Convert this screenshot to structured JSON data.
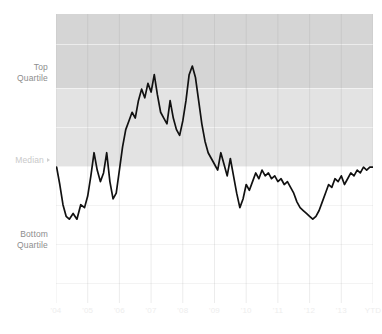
{
  "chart_data": {
    "type": "line",
    "title": "",
    "subtitle": "",
    "xlabel": "",
    "ylabel": "",
    "grid": true,
    "legend_position": "none",
    "y_axis": {
      "kind": "quartile-bands",
      "tick_labels": [
        "Top Quartile",
        "Median",
        "Bottom Quartile"
      ],
      "band_labels": {
        "top_quartile": "Top\nQuartile",
        "median": "Median",
        "bottom_quartile": "Bottom\nQuartile"
      },
      "ylim": [
        0,
        100
      ],
      "reference_lines": [
        {
          "name": "top-quartile",
          "value": 74
        },
        {
          "name": "median",
          "value": 47
        }
      ]
    },
    "x_axis": {
      "tick_labels": [
        "'04",
        "'05",
        "'06",
        "'07",
        "'08",
        "'09",
        "'10",
        "'11",
        "'12",
        "'13",
        "YTD"
      ]
    },
    "bands": [
      {
        "name": "above-top-quartile",
        "from": 74,
        "to": 100,
        "color": "#d5d5d5"
      },
      {
        "name": "top-quartile-to-median",
        "from": 47,
        "to": 74,
        "color": "#e3e3e3"
      },
      {
        "name": "below-median",
        "from": 0,
        "to": 47,
        "color": "#ffffff"
      }
    ],
    "series": [
      {
        "name": "percentile-rank",
        "color": "#111111",
        "x": [
          2004.02,
          2004.12,
          2004.22,
          2004.32,
          2004.42,
          2004.54,
          2004.66,
          2004.78,
          2004.9,
          2005.0,
          2005.1,
          2005.2,
          2005.3,
          2005.4,
          2005.5,
          2005.6,
          2005.7,
          2005.8,
          2005.9,
          2006.0,
          2006.1,
          2006.2,
          2006.3,
          2006.4,
          2006.5,
          2006.6,
          2006.7,
          2006.8,
          2006.9,
          2007.0,
          2007.1,
          2007.2,
          2007.3,
          2007.4,
          2007.5,
          2007.6,
          2007.7,
          2007.8,
          2007.9,
          2008.0,
          2008.1,
          2008.2,
          2008.3,
          2008.4,
          2008.5,
          2008.6,
          2008.7,
          2008.8,
          2008.9,
          2009.0,
          2009.1,
          2009.2,
          2009.3,
          2009.4,
          2009.5,
          2009.6,
          2009.7,
          2009.8,
          2009.9,
          2010.0,
          2010.1,
          2010.2,
          2010.3,
          2010.4,
          2010.5,
          2010.6,
          2010.7,
          2010.8,
          2010.9,
          2011.0,
          2011.1,
          2011.2,
          2011.3,
          2011.4,
          2011.5,
          2011.6,
          2011.7,
          2011.8,
          2011.9,
          2012.0,
          2012.1,
          2012.2,
          2012.3,
          2012.4,
          2012.5,
          2012.6,
          2012.7,
          2012.8,
          2012.9,
          2013.0,
          2013.1,
          2013.2,
          2013.3,
          2013.4,
          2013.5,
          2013.6,
          2013.7,
          2013.8,
          2013.9,
          2014.0
        ],
        "values": [
          47,
          41,
          34,
          30,
          29,
          31,
          29,
          34,
          33,
          37,
          44,
          52,
          46,
          42,
          45,
          52,
          42,
          36,
          38,
          46,
          54,
          60,
          63,
          66,
          64,
          70,
          74,
          71,
          76,
          73,
          79,
          72,
          66,
          64,
          62,
          70,
          64,
          60,
          58,
          63,
          70,
          79,
          82,
          78,
          70,
          62,
          56,
          52,
          50,
          48,
          46,
          52,
          48,
          44,
          50,
          44,
          38,
          33,
          36,
          41,
          39,
          42,
          45,
          43,
          46,
          44,
          45,
          43,
          44,
          42,
          43,
          41,
          42,
          40,
          38,
          35,
          33,
          32,
          31,
          30,
          29,
          30,
          32,
          35,
          38,
          41,
          40,
          43,
          42,
          44,
          41,
          43,
          45,
          44,
          46,
          45,
          47,
          46,
          47,
          47
        ]
      }
    ]
  },
  "axis_labels": {
    "top_quartile_line1": "Top",
    "top_quartile_line2": "Quartile",
    "median": "Median",
    "bottom_quartile_line1": "Bottom",
    "bottom_quartile_line2": "Quartile"
  },
  "x_ticks": [
    {
      "label": "'04"
    },
    {
      "label": "'05"
    },
    {
      "label": "'06"
    },
    {
      "label": "'07"
    },
    {
      "label": "'08"
    },
    {
      "label": "'09"
    },
    {
      "label": "'10"
    },
    {
      "label": "'11"
    },
    {
      "label": "'12"
    },
    {
      "label": "'13"
    },
    {
      "label": "YTD"
    }
  ],
  "colors": {
    "band_above_top": "#d5d5d5",
    "band_top_to_median": "#e3e3e3",
    "band_below_median": "#ffffff",
    "series_line": "#111111",
    "label_text": "#8d8d8d",
    "median_label_text": "#c9c9c9",
    "x_tick_text": "#ededed",
    "page_background": "#ffffff"
  }
}
